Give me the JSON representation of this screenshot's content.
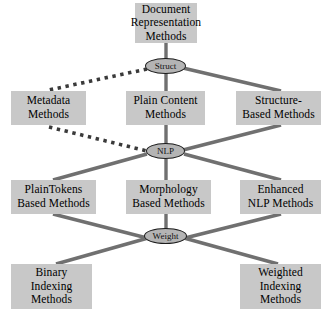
{
  "diagram": {
    "title": "Document Representation Methods",
    "type": "hierarchy-taxonomy",
    "colors": {
      "box_fill": "#c8c8c8",
      "ellipse_fill": "#b4b4b4",
      "ellipse_stroke": "#1c1c1c",
      "edge_solid": "#707070",
      "edge_dotted": "#3a3a3a",
      "background": "#ffffff",
      "text": "#000000"
    },
    "boxes": [
      {
        "id": "document-representation-methods",
        "lines": [
          "Document",
          "Representation",
          "Methods"
        ],
        "x": 135,
        "y": 3,
        "w": 62,
        "h": 40
      },
      {
        "id": "metadata-methods",
        "lines": [
          "Metadata",
          "Methods"
        ],
        "x": 11,
        "y": 91,
        "w": 75,
        "h": 34
      },
      {
        "id": "plain-content-methods",
        "lines": [
          "Plain Content",
          "Methods"
        ],
        "x": 126,
        "y": 91,
        "w": 79,
        "h": 34
      },
      {
        "id": "structure-based-methods",
        "lines": [
          "Structure-",
          "Based Methods"
        ],
        "x": 236,
        "y": 91,
        "w": 85,
        "h": 34
      },
      {
        "id": "plaintokens-based-methods",
        "lines": [
          "PlainTokens",
          "Based Methods"
        ],
        "x": 11,
        "y": 180,
        "w": 85,
        "h": 34
      },
      {
        "id": "morphology-based-methods",
        "lines": [
          "Morphology",
          "Based Methods"
        ],
        "x": 126,
        "y": 180,
        "w": 85,
        "h": 34
      },
      {
        "id": "enhanced-nlp-methods",
        "lines": [
          "Enhanced",
          "NLP Methods"
        ],
        "x": 240,
        "y": 180,
        "w": 81,
        "h": 34
      },
      {
        "id": "binary-indexing-methods",
        "lines": [
          "Binary",
          "Indexing",
          "Methods"
        ],
        "x": 11,
        "y": 264,
        "w": 81,
        "h": 45
      },
      {
        "id": "weighted-indexing-methods",
        "lines": [
          "Weighted",
          "Indexing",
          "Methods"
        ],
        "x": 240,
        "y": 264,
        "w": 81,
        "h": 45
      }
    ],
    "ellipses": [
      {
        "id": "struct",
        "label": "Struct",
        "cx": 165,
        "cy": 66,
        "rx": 20,
        "ry": 8
      },
      {
        "id": "nlp",
        "label": "NLP",
        "cx": 165,
        "cy": 151,
        "rx": 19,
        "ry": 8
      },
      {
        "id": "weight",
        "label": "Weight",
        "cx": 165,
        "cy": 236,
        "rx": 21,
        "ry": 8
      }
    ],
    "edges": [
      {
        "from": "document-representation-methods",
        "to": "struct",
        "style": "solid"
      },
      {
        "from": "struct",
        "to": "metadata-methods",
        "style": "dotted"
      },
      {
        "from": "struct",
        "to": "plain-content-methods",
        "style": "solid"
      },
      {
        "from": "struct",
        "to": "structure-based-methods",
        "style": "solid"
      },
      {
        "from": "metadata-methods",
        "to": "nlp",
        "style": "dotted"
      },
      {
        "from": "plain-content-methods",
        "to": "nlp",
        "style": "solid"
      },
      {
        "from": "structure-based-methods",
        "to": "nlp",
        "style": "solid"
      },
      {
        "from": "nlp",
        "to": "plaintokens-based-methods",
        "style": "solid"
      },
      {
        "from": "nlp",
        "to": "morphology-based-methods",
        "style": "solid"
      },
      {
        "from": "nlp",
        "to": "enhanced-nlp-methods",
        "style": "solid"
      },
      {
        "from": "plaintokens-based-methods",
        "to": "weight",
        "style": "solid"
      },
      {
        "from": "morphology-based-methods",
        "to": "weight",
        "style": "solid"
      },
      {
        "from": "enhanced-nlp-methods",
        "to": "weight",
        "style": "solid"
      },
      {
        "from": "weight",
        "to": "binary-indexing-methods",
        "style": "solid"
      },
      {
        "from": "weight",
        "to": "weighted-indexing-methods",
        "style": "solid"
      }
    ]
  }
}
